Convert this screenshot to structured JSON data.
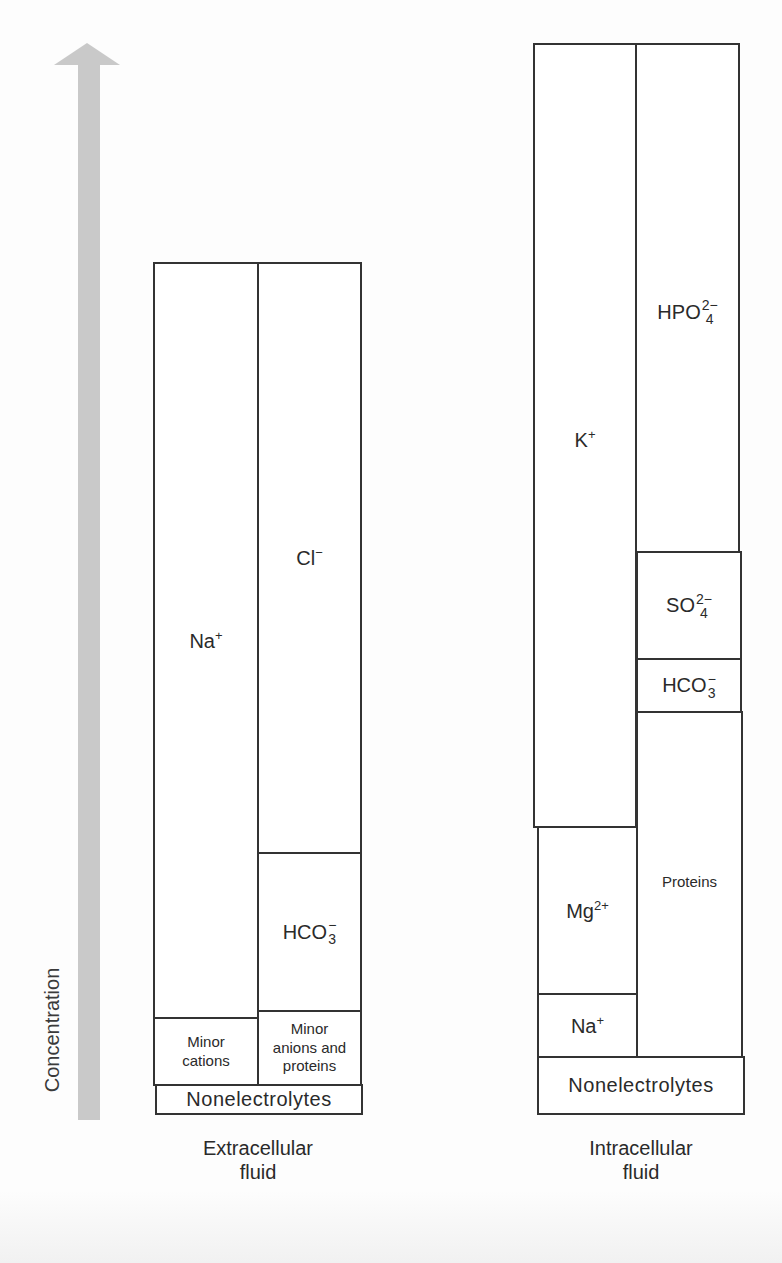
{
  "axis": {
    "label": "Concentration",
    "arrow_icon": "up-arrow",
    "arrow_color": "#c9c9c9"
  },
  "extracellular": {
    "caption_line1": "Extracellular",
    "caption_line2": "fluid",
    "cations": [
      {
        "label": "Na",
        "charge": "+",
        "top": 262,
        "bottom": 1017
      },
      {
        "label_line1": "Minor",
        "label_line2": "cations",
        "top": 1017,
        "bottom": 1084
      }
    ],
    "anions": [
      {
        "label": "Cl",
        "charge": "−",
        "top": 262,
        "bottom": 852
      },
      {
        "label": "HCO",
        "subscript": "3",
        "charge": "−",
        "top": 852,
        "bottom": 1010
      },
      {
        "label_line1": "Minor",
        "label_line2": "anions and",
        "label_line3": "proteins",
        "top": 1010,
        "bottom": 1084
      }
    ],
    "nonelectrolytes": {
      "label": "Nonelectrolytes",
      "top": 1084,
      "bottom": 1114
    }
  },
  "intracellular": {
    "caption_line1": "Intracellular",
    "caption_line2": "fluid",
    "cations": [
      {
        "label": "K",
        "charge": "+",
        "top": 43,
        "bottom": 826
      },
      {
        "label": "Mg",
        "charge": "2+",
        "top": 826,
        "bottom": 993
      },
      {
        "label": "Na",
        "charge": "+",
        "top": 993,
        "bottom": 1056
      }
    ],
    "anions": [
      {
        "label": "HPO",
        "subscript": "4",
        "charge": "2−",
        "top": 43,
        "bottom": 551
      },
      {
        "label": "SO",
        "subscript": "4",
        "charge": "2−",
        "top": 551,
        "bottom": 658
      },
      {
        "label": "HCO",
        "subscript": "3",
        "charge": "−",
        "top": 658,
        "bottom": 711
      },
      {
        "label": "Proteins",
        "top": 711,
        "bottom": 1056
      }
    ],
    "nonelectrolytes": {
      "label": "Nonelectrolytes",
      "top": 1056,
      "bottom": 1114
    }
  }
}
